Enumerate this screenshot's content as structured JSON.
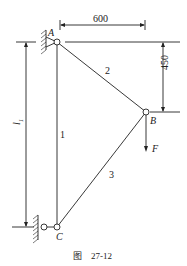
{
  "diagram": {
    "nodes": [
      {
        "id": "A",
        "label": "A"
      },
      {
        "id": "B",
        "label": "B"
      },
      {
        "id": "C",
        "label": "C"
      }
    ],
    "members": [
      {
        "id": "1",
        "label": "1",
        "from": "A",
        "to": "C"
      },
      {
        "id": "2",
        "label": "2",
        "from": "A",
        "to": "B"
      },
      {
        "id": "3",
        "label": "3",
        "from": "B",
        "to": "C"
      }
    ],
    "load": {
      "label": "F",
      "at": "B",
      "direction": "down"
    },
    "dimensions": {
      "horizontal": "600",
      "vertical": "450",
      "length_label": "l",
      "length_subscript": "1"
    },
    "caption": "图    27-12"
  }
}
